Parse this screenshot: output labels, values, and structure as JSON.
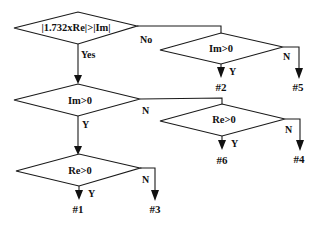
{
  "diagram": {
    "type": "decision-flowchart",
    "nodes": {
      "root": {
        "label": "|1.732xRe|>|Im|"
      },
      "no_branch": {
        "label": "Im>0"
      },
      "yes_branch": {
        "label": "Im>0"
      },
      "yes_no_branch": {
        "label": "Re>0"
      },
      "yes_yes_branch": {
        "label": "Re>0"
      }
    },
    "edges": {
      "root_yes": "Yes",
      "root_no": "No",
      "no_y": "Y",
      "no_n": "N",
      "yes_y": "Y",
      "yes_n": "N",
      "yn_y": "Y",
      "yn_n": "N",
      "yy_y": "Y",
      "yy_n": "N"
    },
    "outcomes": {
      "o1": "#1",
      "o2": "#2",
      "o3": "#3",
      "o4": "#4",
      "o5": "#5",
      "o6": "#6"
    },
    "colors": {
      "stroke": "#1a1a1a",
      "background": "#ffffff"
    }
  }
}
